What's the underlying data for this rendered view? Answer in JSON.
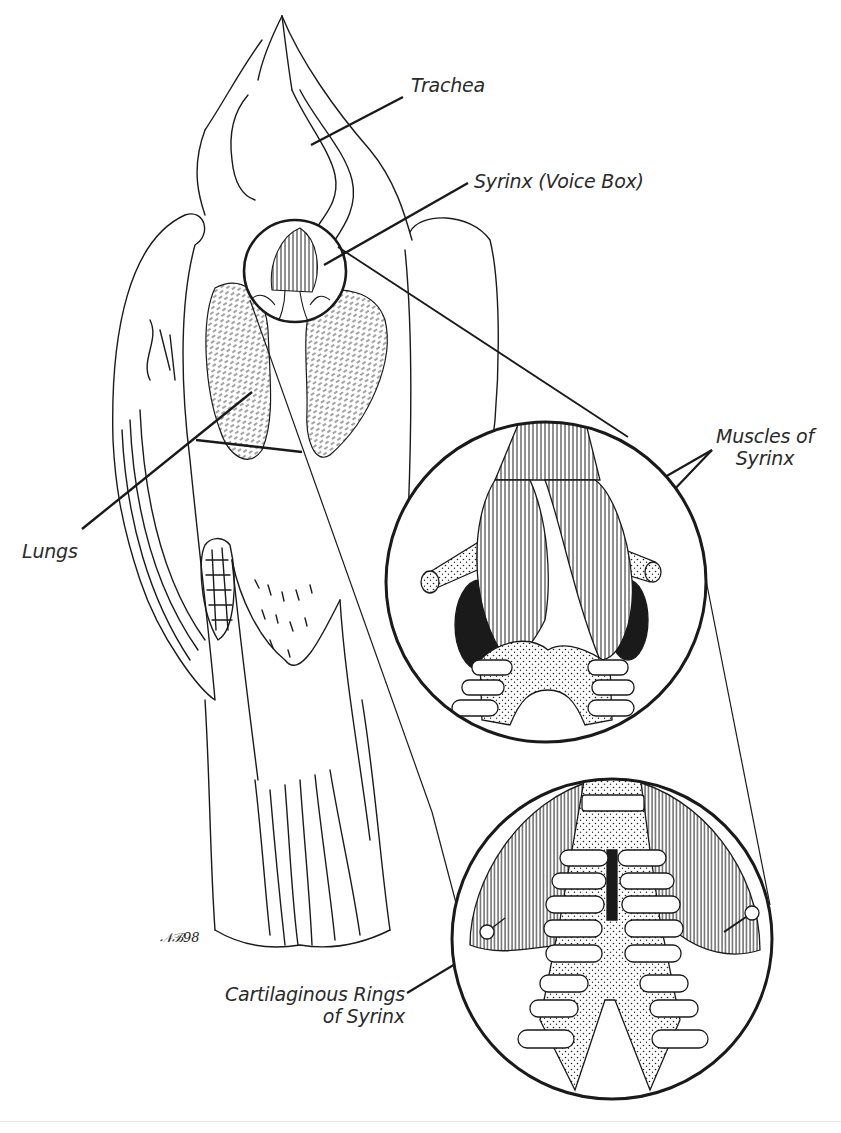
{
  "figure": {
    "colors": {
      "ink": "#1a1a1a",
      "label_text": "#2a2a2a",
      "background": "#ffffff"
    },
    "labels": {
      "trachea": "Trachea",
      "syrinx": "Syrinx (Voice Box)",
      "muscles_line1": "Muscles of",
      "muscles_line2": "Syrinx",
      "lungs": "Lungs",
      "rings_line1": "Cartilaginous Rings",
      "rings_line2": "of Syrinx"
    },
    "signature": "98",
    "insets": [
      {
        "name": "syrinx-detail-small",
        "description": "Small circle around syrinx on bird"
      },
      {
        "name": "syrinx-muscles-magnified",
        "description": "Magnified syrinx with muscles"
      },
      {
        "name": "syrinx-rings-magnified",
        "description": "Magnified syrinx with cartilaginous rings"
      }
    ]
  }
}
